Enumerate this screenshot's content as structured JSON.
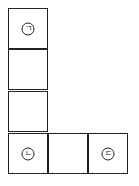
{
  "diagram": {
    "cells": [
      {
        "id": "col-1",
        "label": "ㄱ"
      },
      {
        "id": "col-2",
        "label": ""
      },
      {
        "id": "col-3",
        "label": ""
      },
      {
        "id": "col-4",
        "label": "ㄴ"
      },
      {
        "id": "row-2",
        "label": ""
      },
      {
        "id": "row-3",
        "label": "ㄷ"
      }
    ],
    "colors": {
      "line": "#222222",
      "background": "#ffffff"
    }
  }
}
